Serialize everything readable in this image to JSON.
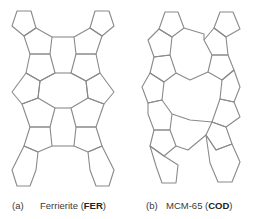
{
  "figures": [
    {
      "id": "a",
      "label": "(a)",
      "name": "Ferrierite (",
      "code": "FER",
      "close": ")"
    },
    {
      "id": "b",
      "label": "(b)",
      "name": "MCM-65 (",
      "code": "COD",
      "close": ")"
    }
  ],
  "colors": {
    "line": "#8a8a8a",
    "text": "#3a3a3a",
    "background": "#ffffff"
  }
}
